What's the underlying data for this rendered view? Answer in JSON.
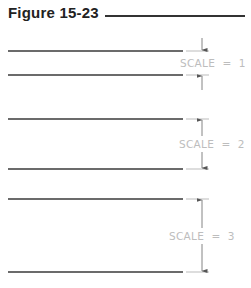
{
  "figure": {
    "title": "Figure 15-23"
  },
  "groups": [
    {
      "label": "SCALE  =  1",
      "scale": 1,
      "top_y": 51,
      "bottom_y": 75,
      "arrows": "outside"
    },
    {
      "label": "SCALE  =  2",
      "scale": 2,
      "top_y": 119,
      "bottom_y": 169,
      "arrows": "inside"
    },
    {
      "label": "SCALE  =  3",
      "scale": 3,
      "top_y": 199,
      "bottom_y": 272,
      "arrows": "inside"
    }
  ],
  "colors": {
    "line": "#3a3a3a",
    "dimension": "#888888",
    "label": "#bdbdbd"
  }
}
